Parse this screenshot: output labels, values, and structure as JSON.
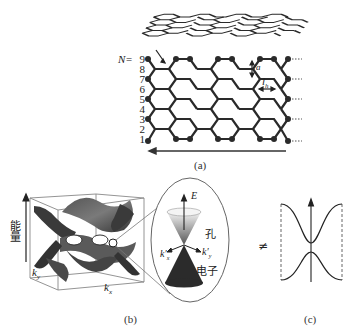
{
  "panel_a": {
    "caption": "(a)",
    "row_label_prefix": "N=",
    "row_numbers": [
      "9",
      "8",
      "7",
      "6",
      "5",
      "4",
      "3",
      "2",
      "1"
    ],
    "dimension_labels": {
      "a": "a",
      "lh": "l",
      "lh_sub": "h"
    }
  },
  "panel_b": {
    "caption": "(b)",
    "y_axis_label": "能量",
    "kx_label": "k",
    "kx_sub": "x",
    "ky_label": "k",
    "ky_sub": "y",
    "cone": {
      "e_label": "E",
      "hole_label": "孔",
      "electron_label": "电子",
      "kx_prime": "k′",
      "kx_prime_sub": "x",
      "ky_prime": "k′",
      "ky_prime_sub": "y"
    }
  },
  "panel_c": {
    "caption": "(c)",
    "not_equal_symbol": "≠"
  },
  "colors": {
    "lattice": "#2a2a2a",
    "surface_dark": "#3a3a3a",
    "surface_mid": "#6a6a6a",
    "cone_lower": "#2b2b2b",
    "box_line": "#777777"
  }
}
